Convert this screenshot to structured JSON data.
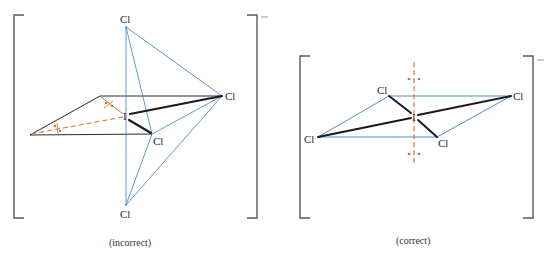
{
  "colors": {
    "bracket": "#5a5a5a",
    "black_bond": "#1a1a1a",
    "plane_edge": "#2a2a2a",
    "blue_edge": "#4a8fd0",
    "orange_lone_pair": "#d2712a",
    "text": "#2a2a2a"
  },
  "left_diagram": {
    "caption": "(incorrect)",
    "charge": "–",
    "atoms": {
      "top": "Cl",
      "right": "Cl",
      "center": "I",
      "front": "Cl",
      "bottom": "Cl"
    },
    "lone_pairs": 2,
    "lone_pair_arrangement": "equatorial (in plane)"
  },
  "right_diagram": {
    "caption": "(correct)",
    "charge": "–",
    "atoms": {
      "back_left": "Cl",
      "right": "Cl",
      "center": "I",
      "left": "Cl",
      "front_right": "Cl"
    },
    "lone_pairs": 2,
    "lone_pair_arrangement": "axial (above and below plane)"
  }
}
